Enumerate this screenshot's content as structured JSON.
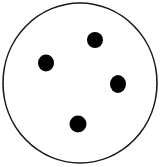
{
  "diagram": {
    "background": "#ffffff",
    "stroke_color": "#1a1a1a",
    "dot_color": "#000000",
    "outer_circle": {
      "cx": 80,
      "cy": 83,
      "rx": 77,
      "ry": 80,
      "stroke_width": 1.6
    },
    "dots": [
      {
        "id": "dot-top",
        "cx": 95,
        "cy": 40,
        "rx": 8,
        "ry": 8
      },
      {
        "id": "dot-left",
        "cx": 46,
        "cy": 63,
        "rx": 8,
        "ry": 8.5
      },
      {
        "id": "dot-right",
        "cx": 118,
        "cy": 84,
        "rx": 8,
        "ry": 9
      },
      {
        "id": "dot-bottom",
        "cx": 78,
        "cy": 124,
        "rx": 8.5,
        "ry": 8.5
      }
    ],
    "dot_count": 4
  }
}
